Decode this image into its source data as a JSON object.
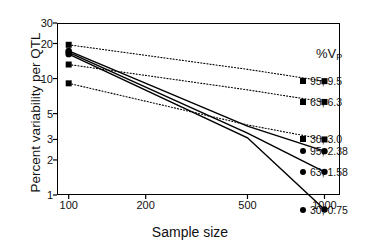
{
  "chart_data": {
    "type": "line",
    "title": "",
    "xlabel": "Sample size",
    "ylabel": "Percent variability per QTL",
    "xscale": "log",
    "yscale": "log",
    "xlim": [
      90,
      1150
    ],
    "ylim": [
      1,
      30
    ],
    "xticks": [
      100,
      200,
      500,
      1000
    ],
    "xtick_labels": [
      "100",
      "200",
      "500",
      "1000"
    ],
    "yticks": [
      1,
      2,
      3,
      5,
      10,
      20,
      30
    ],
    "ytick_labels": [
      "1",
      "2",
      "3",
      "5",
      "10",
      "20",
      "30"
    ],
    "grid": false,
    "legend_title": "%V",
    "legend_title_sub": "P",
    "legend_position": "right",
    "x": [
      100,
      500,
      1000
    ],
    "series": [
      {
        "name": "95, 9.5",
        "label": "95, 9.5",
        "values": [
          19.5,
          12.0,
          9.5
        ],
        "linestyle": "dotted",
        "marker": "square",
        "color": "#000000"
      },
      {
        "name": "63, 6.3",
        "label": "63, 6.3",
        "values": [
          13.2,
          8.0,
          6.3
        ],
        "linestyle": "dotted",
        "marker": "square",
        "color": "#000000"
      },
      {
        "name": "30, 3.0",
        "label": "30, 3.0",
        "values": [
          9.1,
          4.0,
          3.0
        ],
        "linestyle": "dotted",
        "marker": "square",
        "color": "#000000"
      },
      {
        "name": "95, 2.38",
        "label": "95, 2.38",
        "values": [
          17.3,
          3.9,
          2.38
        ],
        "linestyle": "solid",
        "marker": "circle",
        "color": "#000000"
      },
      {
        "name": "63, 1.58",
        "label": "63, 1.58",
        "values": [
          16.8,
          3.4,
          1.58
        ],
        "linestyle": "solid",
        "marker": "circle",
        "color": "#000000"
      },
      {
        "name": "30, 0.75",
        "label": "30, 0.75",
        "values": [
          16.2,
          3.1,
          0.75
        ],
        "linestyle": "solid",
        "marker": "circle",
        "color": "#000000"
      }
    ]
  }
}
